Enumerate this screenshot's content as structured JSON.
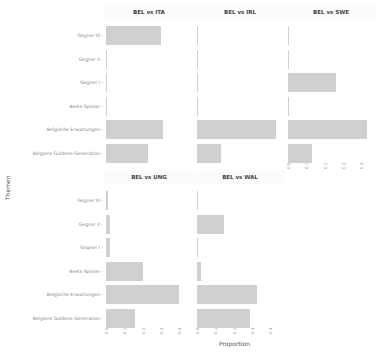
{
  "chart_data": {
    "type": "bar",
    "orientation": "horizontal",
    "facet_layout": {
      "rows": 2,
      "cols": 3
    },
    "xlabel": "Proportion",
    "ylabel": "Themen",
    "xlim": [
      0,
      0.44
    ],
    "xticks": [
      "0.0",
      "0.1",
      "0.2",
      "0.3",
      "0.4"
    ],
    "categories": [
      "Gegner III",
      "Gegner II",
      "Gegner I",
      "Beste Spieler",
      "Belgische Erwartungen",
      "Belgiens Goldene Generation"
    ],
    "series": [
      {
        "name": "BEL vs ITA",
        "values": [
          0.3,
          0.005,
          0.0,
          0.005,
          0.31,
          0.23
        ]
      },
      {
        "name": "BEL vs IRL",
        "values": [
          0.005,
          0.0,
          0.0,
          0.0,
          0.43,
          0.13
        ]
      },
      {
        "name": "BEL vs SWE",
        "values": [
          0.0,
          0.0,
          0.26,
          0.0,
          0.43,
          0.13
        ]
      },
      {
        "name": "BEL vs UNG",
        "values": [
          0.01,
          0.02,
          0.02,
          0.2,
          0.4,
          0.16
        ]
      },
      {
        "name": "BEL vs WAL",
        "values": [
          0.005,
          0.15,
          0.0,
          0.02,
          0.33,
          0.29
        ]
      }
    ],
    "bar_color": "#d0d0d0",
    "grid": false,
    "legend": "none"
  },
  "labels": {
    "xlabel": "Proportion",
    "ylabel": "Themen"
  }
}
